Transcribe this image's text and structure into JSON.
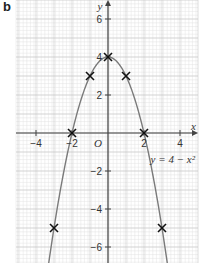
{
  "panel_label": "b",
  "chart_data": {
    "type": "line",
    "title": "",
    "equation_label": "y = 4 − x²",
    "xlabel": "x",
    "ylabel": "y",
    "origin_label": "O",
    "xlim": [
      -5,
      5
    ],
    "ylim": [
      -7,
      7
    ],
    "x_ticks": [
      -4,
      -2,
      2,
      4
    ],
    "x_tick_labels": [
      "−4",
      "−2",
      "2",
      "4"
    ],
    "y_ticks": [
      6,
      4,
      2,
      -2,
      -4,
      -6
    ],
    "y_tick_labels": [
      "6",
      "4",
      "2",
      "−2",
      "−4",
      "−6"
    ],
    "grid": true,
    "series": [
      {
        "name": "y = 4 − x²",
        "function": "4 - x^2",
        "color": "#7a7a7a"
      }
    ],
    "plotted_points": [
      {
        "x": -3,
        "y": -5
      },
      {
        "x": -2,
        "y": 0
      },
      {
        "x": -1,
        "y": 3
      },
      {
        "x": 0,
        "y": 4
      },
      {
        "x": 1,
        "y": 3
      },
      {
        "x": 2,
        "y": 0
      },
      {
        "x": 3,
        "y": -5
      }
    ],
    "marker": "x"
  }
}
